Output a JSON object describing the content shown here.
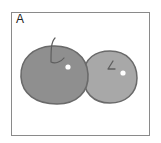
{
  "figure": {
    "panel_label": "A",
    "colors": {
      "border": "#8a8a8a",
      "left_apple_fill": "#8f8f8f",
      "right_apple_fill": "#a8a8a8",
      "outline": "#6a6a6a",
      "highlight": "#ffffff"
    }
  }
}
